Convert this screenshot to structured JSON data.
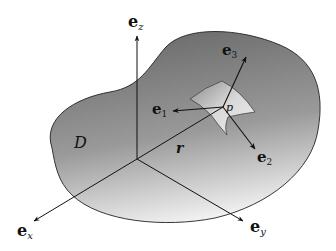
{
  "diagram": {
    "region_label": "D",
    "point_label": "p",
    "position_vector_label": "r",
    "axes": {
      "x": {
        "base": "e",
        "sub": "x"
      },
      "y": {
        "base": "e",
        "sub": "y"
      },
      "z": {
        "base": "e",
        "sub": "z"
      }
    },
    "local_frame": {
      "e1": {
        "base": "e",
        "sub": "1"
      },
      "e2": {
        "base": "e",
        "sub": "2"
      },
      "e3": {
        "base": "e",
        "sub": "3"
      }
    },
    "colors": {
      "region_fill_top": "#707070",
      "region_fill_bottom": "#f2f2f2",
      "patch_fill": "#d0d0d0",
      "line": "#111111"
    }
  }
}
